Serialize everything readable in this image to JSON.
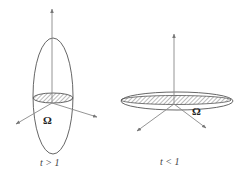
{
  "figures": [
    {
      "id": "prolate",
      "region_label": "Ω",
      "caption": "t > 1",
      "shape": "tall-ellipsoid"
    },
    {
      "id": "oblate",
      "region_label": "Ω",
      "caption": "t < 1",
      "shape": "flat-ellipsoid"
    }
  ],
  "colors": {
    "stroke": "#555555",
    "axis": "#888888",
    "hatch": "#666666"
  }
}
